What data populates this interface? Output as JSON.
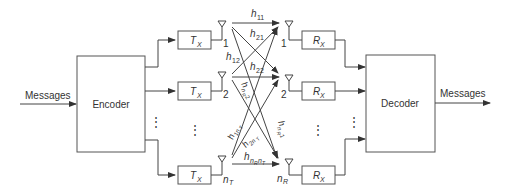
{
  "diagram": {
    "input_label": "Messages",
    "output_label": "Messages",
    "encoder_label": "Encoder",
    "decoder_label": "Decoder",
    "transmitter_label": "T",
    "transmitter_sub": "X",
    "receiver_label": "R",
    "receiver_sub": "X",
    "tx_antennas": [
      {
        "index_label": "1"
      },
      {
        "index_label": "2"
      },
      {
        "index_label": "n",
        "index_sub": "T"
      }
    ],
    "rx_antennas": [
      {
        "index_label": "1"
      },
      {
        "index_label": "2"
      },
      {
        "index_label": "n",
        "index_sub": "R"
      }
    ],
    "ellipsis": "⋮",
    "channel_gains": [
      {
        "base": "h",
        "sub": "11"
      },
      {
        "base": "h",
        "sub": "21"
      },
      {
        "base": "h",
        "sub": "12"
      },
      {
        "base": "h",
        "sub": "22"
      },
      {
        "base": "h",
        "sub": "n",
        "subsub": "R",
        "sub2": "2"
      },
      {
        "base": "h",
        "sub": "1n",
        "subsub": "T"
      },
      {
        "base": "h",
        "sub": "2n",
        "subsub": "T"
      },
      {
        "base": "h",
        "sub": "n",
        "subsub": "R",
        "sub2": "1"
      },
      {
        "base": "h",
        "sub": "n",
        "subsub": "R",
        "sub3": "n",
        "subsub3": "T"
      }
    ],
    "colors": {
      "line": "#444444",
      "box": "#555555",
      "text": "#333333",
      "background": "#ffffff"
    }
  }
}
